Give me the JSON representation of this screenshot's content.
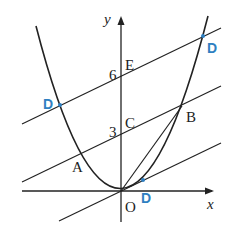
{
  "diagram": {
    "type": "coordinate-geometry",
    "axes": {
      "x_label": "x",
      "y_label": "y",
      "origin_label": "O"
    },
    "y_ticks": [
      {
        "value": "6",
        "point": "E"
      },
      {
        "value": "3",
        "point": "C"
      }
    ],
    "curve": "parabola through origin, opening upward",
    "points": {
      "A": "A",
      "B": "B",
      "C": "C",
      "E": "E",
      "O": "O",
      "D": "D"
    },
    "point_D_labels": [
      "D",
      "D",
      "D"
    ],
    "colors": {
      "stroke": "#222222",
      "highlight": "#2f7fc1"
    },
    "lines": [
      "line through E parallel to AB",
      "line AB through C",
      "line through O parallel to AB",
      "segment OB"
    ]
  }
}
